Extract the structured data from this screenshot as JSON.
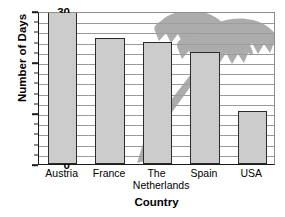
{
  "chart_data": {
    "type": "bar",
    "title": "",
    "categories": [
      "Austria",
      "France",
      "The Netherlands",
      "Spain",
      "USA"
    ],
    "category_lines": [
      [
        "Austria"
      ],
      [
        "France"
      ],
      [
        "The",
        "Netherlands"
      ],
      [
        "Spain"
      ],
      [
        "USA"
      ]
    ],
    "values": [
      30,
      24.8,
      24,
      22,
      10.3
    ],
    "xlabel": "Country",
    "ylabel": "Number of Days",
    "ylim": [
      0,
      30
    ],
    "y_ticks_major": [
      0,
      10,
      20,
      30
    ],
    "y_tick_labels": [
      "0",
      "10",
      "20",
      "30"
    ],
    "y_ticks_minor_step": 2,
    "grid": true,
    "grid_step": 2,
    "legend": "none",
    "bar_fill_color": "#cccccc",
    "bar_edge_color": "#2b2b2b",
    "grid_color": "#9a9a9a",
    "axis_color": "#1a1a1a",
    "background_color": "#ffffff",
    "watermark": {
      "name": "palm-tree-watermark",
      "color": "#9e9e9e",
      "description": "gray palm tree graphic overlapping upper-right of plot"
    }
  }
}
